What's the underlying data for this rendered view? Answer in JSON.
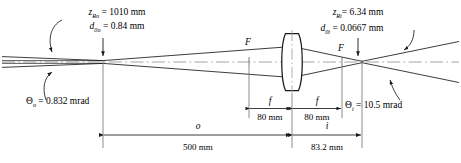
{
  "diagram": {
    "type": "gaussian-beam-lens-imaging",
    "axis_label": "optical-axis",
    "object_side": {
      "rayleigh": {
        "symbol": "z",
        "sub": "Ro",
        "eq": "=",
        "value": "1010",
        "unit": "mm"
      },
      "waist": {
        "symbol": "d",
        "sub": "0o",
        "eq": "=",
        "value": "0.84",
        "unit": "mm"
      },
      "divergence": {
        "symbol": "Θ",
        "sub": "o",
        "eq": "=",
        "value": "0.832",
        "unit": "mrad"
      }
    },
    "image_side": {
      "rayleigh": {
        "symbol": "z",
        "sub": "Ri",
        "eq": "=",
        "value": "6.34",
        "unit": "mm"
      },
      "waist": {
        "symbol": "d",
        "sub": "0i",
        "eq": "=",
        "value": "0.0667",
        "unit": "mm"
      },
      "divergence": {
        "symbol": "Θ",
        "sub": "i",
        "eq": "=",
        "value": "10.5",
        "unit": "mrad"
      }
    },
    "focal_points": [
      {
        "label": "F",
        "side": "object"
      },
      {
        "label": "F",
        "side": "image"
      }
    ],
    "dimensions": [
      {
        "name": "focal-length-left",
        "symbol": "f",
        "value": "80 mm"
      },
      {
        "name": "focal-length-right",
        "symbol": "f",
        "value": "80 mm"
      },
      {
        "name": "object-distance",
        "symbol": "o",
        "value": "500 mm"
      },
      {
        "name": "image-distance",
        "symbol": "i",
        "value": "83.2 mm"
      }
    ],
    "colors": {
      "ray": "#1a1a1a",
      "axis": "#8c8c8c",
      "construction": "#7a7a7a",
      "lens": "#1a1a1a",
      "background": "#ffffff"
    }
  }
}
